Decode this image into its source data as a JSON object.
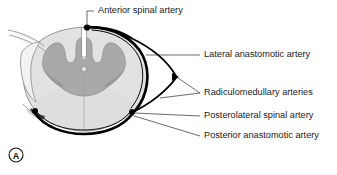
{
  "figure": {
    "panel_letter": "A",
    "background_color": "#ffffff"
  },
  "colors": {
    "vessel": "#000000",
    "gray_matter": "#a9a9a9",
    "gray_matter_dark": "#9b9b9b",
    "white_matter": "#dcdcdc",
    "white_matter_light": "#e6e6e6",
    "outline": "#7c7c7c",
    "text": "#1a1a1a",
    "leader": "#2b2b2b"
  },
  "labels": [
    {
      "id": "anterior-spinal-artery",
      "text": "Anterior spinal artery",
      "x": 98,
      "y": 11,
      "anchor": "start"
    },
    {
      "id": "lateral-anastomotic-artery",
      "text": "Lateral anastomotic artery",
      "x": 204,
      "y": 55,
      "anchor": "start"
    },
    {
      "id": "radiculomedullary-arteries",
      "text": "Radiculomedullary arteries",
      "x": 204,
      "y": 93,
      "anchor": "start"
    },
    {
      "id": "posterolateral-spinal-artery",
      "text": "Posterolateral spinal artery",
      "x": 204,
      "y": 116,
      "anchor": "start"
    },
    {
      "id": "posterior-anastomotic-artery",
      "text": "Posterior anastomotic artery",
      "x": 204,
      "y": 136,
      "anchor": "start"
    }
  ],
  "anatomy": {
    "structures": [
      "dura-arachnoid-outline",
      "white-matter",
      "gray-matter-butterfly",
      "central-canal",
      "anterior-median-fissure",
      "dorsal-rootlets",
      "ventral-rootlets"
    ]
  },
  "vessels": [
    {
      "id": "anterior-spinal-artery-dot",
      "type": "point"
    },
    {
      "id": "lateral-anastomotic-artery-upper",
      "type": "arc"
    },
    {
      "id": "lateral-anastomotic-artery-lower",
      "type": "arc"
    },
    {
      "id": "radiculomedullary-artery-upper",
      "type": "arc"
    },
    {
      "id": "radiculomedullary-artery-lower",
      "type": "arc"
    },
    {
      "id": "posterolateral-spinal-artery-dot-left",
      "type": "point"
    },
    {
      "id": "posterolateral-spinal-artery-dot-right",
      "type": "point"
    },
    {
      "id": "posterior-anastomotic-artery-arc",
      "type": "arc"
    }
  ]
}
